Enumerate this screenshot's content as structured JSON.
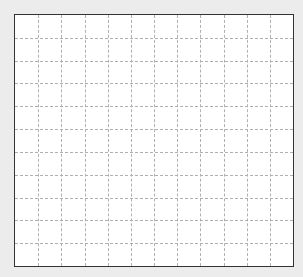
{
  "grid": {
    "columns": 12,
    "rows": 11,
    "background": "#ececec",
    "panel_color": "#ffffff",
    "border_color": "#333333",
    "line_color": "#b0b0b0",
    "line_style": "dashed"
  }
}
